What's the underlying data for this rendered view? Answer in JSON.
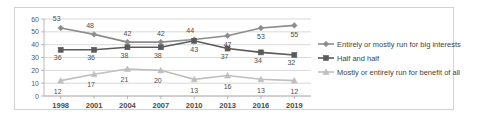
{
  "chart_data": {
    "type": "line",
    "title": "",
    "xlabel": "",
    "ylabel": "",
    "ylim": [
      0,
      60
    ],
    "yticks": [
      "0",
      "10",
      "20",
      "30",
      "40",
      "50",
      "60"
    ],
    "grid": true,
    "legend_position": "right",
    "categories": [
      "1998",
      "2001",
      "2004",
      "2007",
      "2010",
      "2013",
      "2016",
      "2019"
    ],
    "series": [
      {
        "name": "Entirely or mostly run for big interests",
        "marker": "diamond",
        "color": "#8c8c8c",
        "values": [
          53,
          48,
          42,
          42,
          44,
          47,
          53,
          55
        ],
        "labels": [
          "53",
          "48",
          "42",
          "42",
          "44",
          "47",
          "53",
          "55"
        ]
      },
      {
        "name": "Half and half",
        "marker": "square",
        "color": "#5a5a5a",
        "values": [
          36,
          36,
          38,
          38,
          43,
          37,
          34,
          32
        ],
        "labels": [
          "36",
          "36",
          "38",
          "38",
          "43",
          "37",
          "34",
          "32"
        ]
      },
      {
        "name": "Mostly or entirely run for benefit of all",
        "marker": "triangle",
        "color": "#bfbfbf",
        "values": [
          12,
          17,
          21,
          20,
          13,
          16,
          13,
          12
        ],
        "labels": [
          "12",
          "17",
          "21",
          "20",
          "13",
          "16",
          "13",
          "12"
        ]
      }
    ]
  },
  "legend": {
    "items": [
      {
        "label": "Entirely or mostly run for big interests",
        "marker": "diamond-marker-icon"
      },
      {
        "label": "Half and half",
        "marker": "square-marker-icon"
      },
      {
        "label": "Mostly or entirely run for benefit of all",
        "marker": "triangle-marker-icon"
      }
    ]
  }
}
